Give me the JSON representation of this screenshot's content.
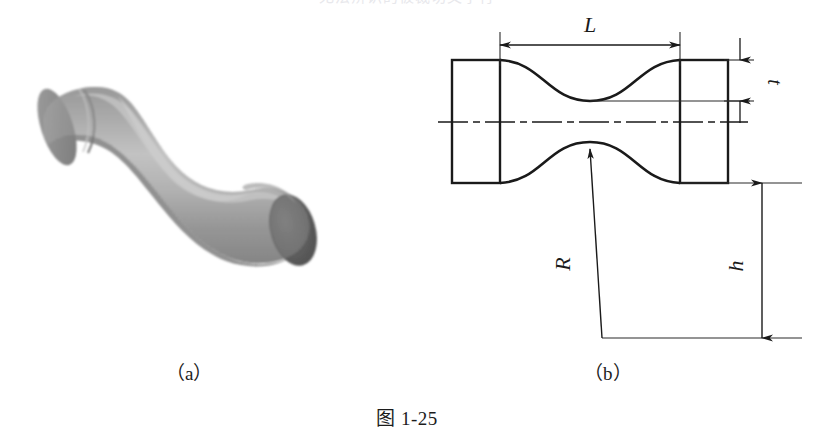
{
  "figure": {
    "caption": "图 1-25",
    "cropped_top_text": "无法辨识的被裁切文字行",
    "panels": [
      {
        "id": "a",
        "label": "（a）",
        "kind": "3d-render",
        "description": "沙漏形（狗骨形）试样三维渲染图"
      },
      {
        "id": "b",
        "label": "（b）",
        "kind": "engineering-drawing",
        "description": "试样二维工程图及尺寸标注"
      }
    ]
  },
  "drawing": {
    "dimensions": [
      {
        "name": "L",
        "label": "L",
        "orientation": "horizontal",
        "note": "标距长度"
      },
      {
        "name": "t",
        "label": "t",
        "orientation": "vertical",
        "note": "厚度/颈部高差"
      },
      {
        "name": "h",
        "label": "h",
        "orientation": "vertical",
        "note": "夹持端高度"
      },
      {
        "name": "R",
        "label": "R",
        "orientation": "leader",
        "note": "圆弧半径"
      }
    ],
    "line_styles": {
      "outline": "solid",
      "centerline": "dash-dot",
      "dimension": "thin-solid-with-arrows",
      "extension": "thin-solid"
    }
  },
  "colors": {
    "ink": "#1a1a1a",
    "thin_ink": "#2b2b2b",
    "paper": "#ffffff",
    "render_light": "#b9b9b9",
    "render_mid": "#909090",
    "render_dark": "#6f6f6f",
    "render_endcap": "#5d5d5d",
    "render_shadow": "#7c7c7c"
  }
}
